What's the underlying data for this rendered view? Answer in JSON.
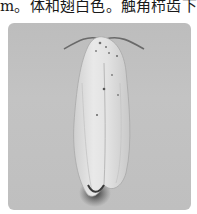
{
  "document": {
    "text_line": "m。体和翅白色。触角栉齿下方"
  },
  "figure": {
    "background_color": "#bfbfbf",
    "subject_color": "#e6e6e6",
    "shadow_color": "#2e2e2e"
  }
}
